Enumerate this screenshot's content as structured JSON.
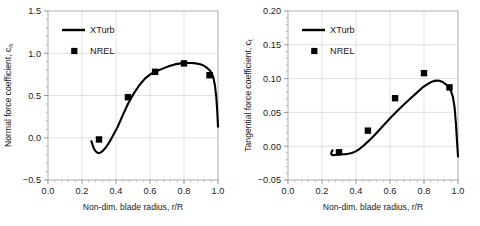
{
  "figure": {
    "background": "#ffffff",
    "line_color": "#000000",
    "grid_color": "#d4d4d4",
    "frame_color": "#9a9a9a"
  },
  "panels": [
    {
      "id": "normal-force",
      "ylabel_main": "Normal force coefficient, c",
      "ylabel_sub": "n",
      "xlabel": "Non-dim. blade radius, r/R",
      "legend": [
        {
          "label": "XTurb",
          "kind": "line"
        },
        {
          "label": "NREL",
          "kind": "marker"
        }
      ]
    },
    {
      "id": "tangential-force",
      "ylabel_main": "Tangential force coefficient, c",
      "ylabel_sub": "t",
      "xlabel": "Non-dim. blade radius, r/R",
      "legend": [
        {
          "label": "XTurb",
          "kind": "line"
        },
        {
          "label": "NREL",
          "kind": "marker"
        }
      ]
    }
  ],
  "chart_data": [
    {
      "type": "line",
      "id": "normal-force",
      "title": "",
      "xlabel": "Non-dim. blade radius, r/R",
      "ylabel": "Normal force coefficient, c_n",
      "xlim": [
        0.0,
        1.0
      ],
      "ylim": [
        -0.5,
        1.5
      ],
      "xticks": [
        "0.0",
        "0.2",
        "0.4",
        "0.6",
        "0.8",
        "1.0"
      ],
      "xtick_values": [
        0.0,
        0.2,
        0.4,
        0.6,
        0.8,
        1.0
      ],
      "yticks": [
        "-0.5",
        "0.0",
        "0.5",
        "1.0",
        "1.5"
      ],
      "ytick_values": [
        -0.5,
        0.0,
        0.5,
        1.0,
        1.5
      ],
      "grid": true,
      "legend_position": "upper-left",
      "series": [
        {
          "name": "XTurb",
          "kind": "line",
          "x": [
            0.255,
            0.262,
            0.27,
            0.28,
            0.292,
            0.3,
            0.312,
            0.325,
            0.34,
            0.36,
            0.385,
            0.41,
            0.44,
            0.47,
            0.5,
            0.535,
            0.57,
            0.605,
            0.64,
            0.675,
            0.71,
            0.745,
            0.78,
            0.81,
            0.845,
            0.87,
            0.895,
            0.915,
            0.935,
            0.95,
            0.962,
            0.972,
            0.982,
            0.99,
            0.996,
            1.0
          ],
          "y": [
            -0.04,
            -0.085,
            -0.128,
            -0.16,
            -0.178,
            -0.182,
            -0.172,
            -0.15,
            -0.115,
            -0.055,
            0.035,
            0.13,
            0.268,
            0.4,
            0.51,
            0.615,
            0.7,
            0.755,
            0.79,
            0.818,
            0.845,
            0.868,
            0.88,
            0.884,
            0.884,
            0.88,
            0.87,
            0.855,
            0.828,
            0.8,
            0.768,
            0.718,
            0.62,
            0.48,
            0.3,
            0.13
          ]
        },
        {
          "name": "NREL",
          "kind": "scatter",
          "x": [
            0.3,
            0.47,
            0.63,
            0.8,
            0.95
          ],
          "y": [
            -0.02,
            0.48,
            0.78,
            0.88,
            0.74
          ]
        }
      ]
    },
    {
      "type": "line",
      "id": "tangential-force",
      "title": "",
      "xlabel": "Non-dim. blade radius, r/R",
      "ylabel": "Tangential force coefficient, c_t",
      "xlim": [
        0.0,
        1.0
      ],
      "ylim": [
        -0.05,
        0.2
      ],
      "xticks": [
        "0.0",
        "0.2",
        "0.4",
        "0.6",
        "0.8",
        "1.0"
      ],
      "xtick_values": [
        0.0,
        0.2,
        0.4,
        0.6,
        0.8,
        1.0
      ],
      "yticks": [
        "-0.05",
        "0.00",
        "0.05",
        "0.10",
        "0.15",
        "0.20"
      ],
      "ytick_values": [
        -0.05,
        0.0,
        0.05,
        0.1,
        0.15,
        0.2
      ],
      "grid": true,
      "legend_position": "upper-left",
      "series": [
        {
          "name": "XTurb",
          "kind": "line",
          "x": [
            0.262,
            0.256,
            0.254,
            0.258,
            0.266,
            0.276,
            0.288,
            0.3,
            0.315,
            0.335,
            0.355,
            0.375,
            0.395,
            0.42,
            0.45,
            0.48,
            0.51,
            0.545,
            0.58,
            0.615,
            0.65,
            0.685,
            0.72,
            0.755,
            0.79,
            0.82,
            0.85,
            0.87,
            0.89,
            0.91,
            0.93,
            0.945,
            0.958,
            0.97,
            0.98,
            0.988,
            0.994,
            1.0
          ],
          "y": [
            -0.006,
            -0.0085,
            -0.0112,
            -0.0128,
            -0.0132,
            -0.013,
            -0.0126,
            -0.0122,
            -0.012,
            -0.0118,
            -0.0112,
            -0.01,
            -0.008,
            -0.0042,
            0.002,
            0.009,
            0.0165,
            0.0262,
            0.0358,
            0.0452,
            0.054,
            0.0625,
            0.0705,
            0.0785,
            0.0865,
            0.0918,
            0.0958,
            0.097,
            0.0968,
            0.095,
            0.0912,
            0.0872,
            0.082,
            0.073,
            0.057,
            0.033,
            0.008,
            -0.015
          ]
        },
        {
          "name": "NREL",
          "kind": "scatter",
          "x": [
            0.3,
            0.47,
            0.63,
            0.8,
            0.95
          ],
          "y": [
            -0.009,
            0.023,
            0.071,
            0.108,
            0.087
          ]
        }
      ]
    }
  ]
}
